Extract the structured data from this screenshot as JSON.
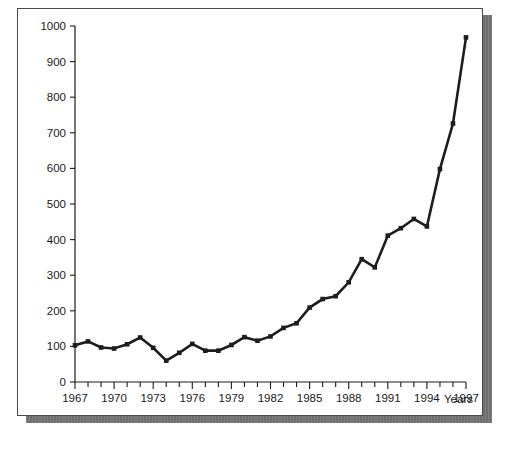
{
  "chart_data": {
    "type": "line",
    "title": "",
    "subtitle": "",
    "xlabel": "Years",
    "ylabel": "",
    "xlim": [
      1967,
      1997
    ],
    "ylim": [
      0,
      1000
    ],
    "grid": false,
    "legend": false,
    "legend_position": "none",
    "x_tick_step": 3,
    "x_minor_tick_step": 1,
    "y_tick_step": 100,
    "series_color": "#1d1d1d",
    "marker": "square",
    "xticklabels": [
      "1967",
      "1970",
      "1973",
      "1976",
      "1979",
      "1982",
      "1985",
      "1988",
      "1991",
      "1994",
      "1997"
    ],
    "yticklabels": [
      "0",
      "100",
      "200",
      "300",
      "400",
      "500",
      "600",
      "700",
      "800",
      "900",
      "1000"
    ],
    "x": [
      1967,
      1968,
      1969,
      1970,
      1971,
      1972,
      1973,
      1974,
      1975,
      1976,
      1977,
      1978,
      1979,
      1980,
      1981,
      1982,
      1983,
      1984,
      1985,
      1986,
      1987,
      1988,
      1989,
      1990,
      1991,
      1992,
      1993,
      1994,
      1995,
      1996,
      1997
    ],
    "values": [
      103,
      114,
      97,
      94,
      106,
      125,
      96,
      60,
      82,
      107,
      88,
      88,
      104,
      126,
      116,
      128,
      152,
      165,
      209,
      233,
      241,
      280,
      345,
      322,
      411,
      432,
      458,
      437,
      598,
      726,
      968
    ],
    "annotations": []
  },
  "figure": {
    "axis_x_title": "Years"
  }
}
